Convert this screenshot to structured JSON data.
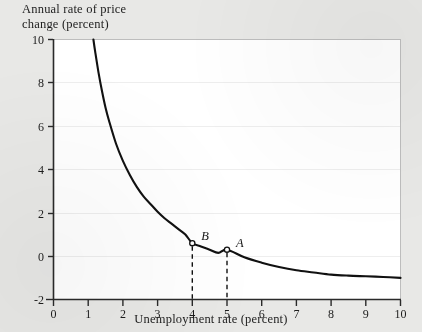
{
  "figure": {
    "background_color": "#e8e8e6",
    "plot_background_color": "#ffffff",
    "curve_color": "#111111",
    "axis_color": "#333333",
    "grid_color": "#eeeeee"
  },
  "chart_data": {
    "type": "line",
    "title": "",
    "ylabel": "Annual rate of price\nchange (percent)",
    "ylabel_line1": "Annual rate of price",
    "ylabel_line2": "change (percent)",
    "xlabel": "Unemployment rate (percent)",
    "xlim": [
      0,
      10
    ],
    "ylim": [
      -2,
      10
    ],
    "xticks": [
      0,
      1,
      2,
      3,
      4,
      5,
      6,
      7,
      8,
      9,
      10
    ],
    "xtick_labels": [
      "0",
      "1",
      "2",
      "3",
      "4",
      "5",
      "6",
      "7",
      "8",
      "9",
      "10"
    ],
    "yticks": [
      -2,
      0,
      2,
      4,
      6,
      8,
      10
    ],
    "ytick_labels": [
      "-2",
      "0",
      "2",
      "4",
      "6",
      "8",
      "10"
    ],
    "grid": "horizontal",
    "legend": "none",
    "series": [
      {
        "name": "Phillips curve",
        "x": [
          1.15,
          1.2,
          1.3,
          1.4,
          1.5,
          1.6,
          1.8,
          2.0,
          2.2,
          2.4,
          2.6,
          2.8,
          3.0,
          3.2,
          3.4,
          3.6,
          3.8,
          4.0,
          4.25,
          4.5,
          4.75,
          5.0,
          5.5,
          6.0,
          6.5,
          7.0,
          7.5,
          8.0,
          8.5,
          9.0,
          9.5,
          10.0
        ],
        "y": [
          10.0,
          9.45,
          8.45,
          7.6,
          6.85,
          6.25,
          5.2,
          4.4,
          3.75,
          3.2,
          2.75,
          2.4,
          2.05,
          1.75,
          1.5,
          1.25,
          1.0,
          0.6,
          0.45,
          0.3,
          0.15,
          0.3,
          -0.05,
          -0.3,
          -0.5,
          -0.65,
          -0.75,
          -0.85,
          -0.9,
          -0.93,
          -0.96,
          -1.0
        ]
      }
    ],
    "annotations": [
      {
        "label": "B",
        "x": 4,
        "y": 0.6,
        "marker": "open-circle",
        "dropline": "dashed",
        "label_dx": 9,
        "label_dy": -14
      },
      {
        "label": "A",
        "x": 5,
        "y": 0.3,
        "marker": "open-circle",
        "dropline": "dashed",
        "label_dx": 9,
        "label_dy": -14
      }
    ]
  }
}
